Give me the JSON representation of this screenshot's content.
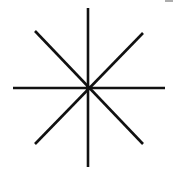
{
  "figure": {
    "stroke_color": "#111111",
    "background": "#ffffff",
    "center": {
      "x": 88,
      "y": 88
    },
    "lines": [
      {
        "name": "vertical",
        "x1": 88,
        "y1": 8,
        "x2": 88,
        "y2": 167
      },
      {
        "name": "horizontal",
        "x1": 13,
        "y1": 88,
        "x2": 165,
        "y2": 88
      },
      {
        "name": "diagonal-down",
        "x1": 35,
        "y1": 31,
        "x2": 143,
        "y2": 144
      },
      {
        "name": "diagonal-up",
        "x1": 143,
        "y1": 33,
        "x2": 35,
        "y2": 144
      }
    ],
    "stroke_width": 2.6
  }
}
